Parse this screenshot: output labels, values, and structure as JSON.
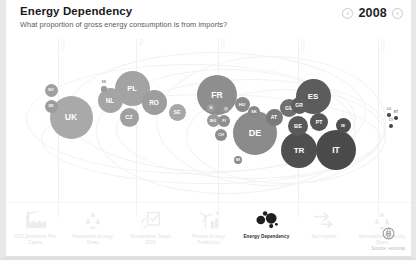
{
  "header": {
    "title": "Energy Dependency",
    "subtitle": "What proportion of gross energy consumption is from imports?",
    "year": "2008",
    "prev_label": "‹",
    "next_label": "›"
  },
  "chart_data": {
    "type": "scatter",
    "title": "Energy Dependency",
    "subtitle": "What proportion of gross energy consumption is from imports?",
    "xlabel": "",
    "ylabel": "",
    "grid": true,
    "legend": "none",
    "year": "2008",
    "gridlines": [
      {
        "x_px": 52,
        "label": "-50%"
      },
      {
        "x_px": 130,
        "label": "0%"
      },
      {
        "x_px": 212,
        "label": "50%"
      },
      {
        "x_px": 292,
        "label": "100%"
      },
      {
        "x_px": 372,
        "label": "150%"
      }
    ],
    "note": "Bubble size encodes energy consumption; horizontal position encodes import dependency share; darker fill = higher dependency.",
    "points": [
      {
        "code": "NO",
        "x_px": 45,
        "y_px": 90,
        "r_px": 6.5,
        "shade": "#a0a0a0",
        "font": 3.6
      },
      {
        "code": "DK",
        "x_px": 45,
        "y_px": 106,
        "r_px": 6.5,
        "shade": "#9c9c9c",
        "font": 3.6
      },
      {
        "code": "UK",
        "x_px": 65,
        "y_px": 117,
        "r_px": 21.5,
        "shade": "#a9a9a9",
        "font": 8.5
      },
      {
        "code": "EE",
        "x_px": 98,
        "y_px": 89,
        "r_px": 2.6,
        "shade": "#9a9a9a",
        "font": 2.4
      },
      {
        "code": "NL",
        "x_px": 104,
        "y_px": 100,
        "r_px": 12.5,
        "shade": "#a5a5a5",
        "font": 6.5
      },
      {
        "code": "PL",
        "x_px": 126,
        "y_px": 88,
        "r_px": 17.5,
        "shade": "#a3a3a3",
        "font": 7.5
      },
      {
        "code": "CZ",
        "x_px": 123,
        "y_px": 117,
        "r_px": 9.5,
        "shade": "#a0a0a0",
        "font": 5.5
      },
      {
        "code": "RO",
        "x_px": 148,
        "y_px": 102,
        "r_px": 12.5,
        "shade": "#9d9d9d",
        "font": 6.5
      },
      {
        "code": "SE",
        "x_px": 171,
        "y_px": 112,
        "r_px": 8.5,
        "shade": "#a7a7a7",
        "font": 5.2
      },
      {
        "code": "SI",
        "x_px": 205,
        "y_px": 108,
        "r_px": 4.0,
        "shade": "#9b9b9b",
        "font": 3.0
      },
      {
        "code": "BG",
        "x_px": 207,
        "y_px": 120,
        "r_px": 6.5,
        "shade": "#9a9a9a",
        "font": 4.0
      },
      {
        "code": "FI",
        "x_px": 218,
        "y_px": 121,
        "r_px": 6.0,
        "shade": "#8f8f8f",
        "font": 3.8
      },
      {
        "code": "CH",
        "x_px": 215,
        "y_px": 135,
        "r_px": 6.0,
        "shade": "#8d8d8d",
        "font": 3.8
      },
      {
        "code": "FR",
        "x_px": 211,
        "y_px": 95,
        "r_px": 20.0,
        "shade": "#8e8e8e",
        "font": 8.5
      },
      {
        "code": "LV",
        "x_px": 220,
        "y_px": 110,
        "r_px": 3.4,
        "shade": "#9a9a9a",
        "font": 2.6
      },
      {
        "code": "HU",
        "x_px": 236,
        "y_px": 104,
        "r_px": 7.5,
        "shade": "#8a8a8a",
        "font": 4.4
      },
      {
        "code": "SK",
        "x_px": 248,
        "y_px": 112,
        "r_px": 6.0,
        "shade": "#878787",
        "font": 3.8
      },
      {
        "code": "DE",
        "x_px": 249,
        "y_px": 133,
        "r_px": 22.0,
        "shade": "#8b8b8b",
        "font": 9.0
      },
      {
        "code": "MK",
        "x_px": 232,
        "y_px": 160,
        "r_px": 4.2,
        "shade": "#8a8a8a",
        "font": 3.0
      },
      {
        "code": "AT",
        "x_px": 268,
        "y_px": 117,
        "r_px": 8.5,
        "shade": "#7a7a7a",
        "font": 5.0
      },
      {
        "code": "GB",
        "x_px": 283,
        "y_px": 108,
        "r_px": 9.0,
        "shade": "#707070",
        "font": 5.2
      },
      {
        "code": "GR",
        "x_px": 293,
        "y_px": 105,
        "r_px": 8.5,
        "shade": "#5e5e5e",
        "font": 5.0
      },
      {
        "code": "ES",
        "x_px": 307,
        "y_px": 96,
        "r_px": 17.5,
        "shade": "#5c5c5c",
        "font": 7.8
      },
      {
        "code": "BE",
        "x_px": 292,
        "y_px": 126,
        "r_px": 10.0,
        "shade": "#5a5a5a",
        "font": 5.6
      },
      {
        "code": "PT",
        "x_px": 313,
        "y_px": 122,
        "r_px": 9.0,
        "shade": "#565656",
        "font": 5.2
      },
      {
        "code": "TR",
        "x_px": 293,
        "y_px": 150,
        "r_px": 18.0,
        "shade": "#4f4f4f",
        "font": 8.0
      },
      {
        "code": "IT",
        "x_px": 330,
        "y_px": 150,
        "r_px": 20.0,
        "shade": "#4a4a4a",
        "font": 8.5
      },
      {
        "code": "IE",
        "x_px": 337,
        "y_px": 125,
        "r_px": 7.5,
        "shade": "#505050",
        "font": 4.4
      },
      {
        "code": "LU",
        "x_px": 383,
        "y_px": 115,
        "r_px": 1.8,
        "shade": "#4a4a4a",
        "font": 2.4
      },
      {
        "code": "MT",
        "x_px": 390,
        "y_px": 118,
        "r_px": 2.2,
        "shade": "#3f3f3f",
        "font": 2.4
      },
      {
        "code": "CY",
        "x_px": 385,
        "y_px": 126,
        "r_px": 2.0,
        "shade": "#454545",
        "font": 2.4
      }
    ]
  },
  "toolbar": {
    "items": [
      {
        "id": "co2-emissions-per-capita",
        "icon": "factory-icon",
        "label": "CO2 Emissions Per Capita",
        "active": false
      },
      {
        "id": "renewable-energy-share",
        "icon": "recycle-icon",
        "label": "Renewable Energy Share",
        "active": false
      },
      {
        "id": "renewables-target-2020",
        "icon": "checklist-icon",
        "label": "Renewables Target 2020",
        "active": false
      },
      {
        "id": "primary-energy-production",
        "icon": "windmill-icon",
        "label": "Primary Energy Production",
        "active": false
      },
      {
        "id": "energy-dependency",
        "icon": "bubbles-icon",
        "label": "Energy Dependency",
        "active": true
      },
      {
        "id": "net-imports",
        "icon": "arrows-right-icon",
        "label": "Net Imports",
        "active": false
      },
      {
        "id": "renewable-electricity-share",
        "icon": "recycle-icon",
        "label": "Renewable Electricity Share",
        "active": false
      }
    ],
    "source_label": "Source: eurostat",
    "source_icon": "eurostat-logo-icon"
  },
  "colors": {
    "background": "#ffffff",
    "frame": "#e8e8e8",
    "gridline": "#f0f0f0",
    "title": "#1a1a1a",
    "subtitle": "#5a5a5a",
    "inactive_label": "#e2e2e2",
    "active_label": "#2b2b2b"
  }
}
